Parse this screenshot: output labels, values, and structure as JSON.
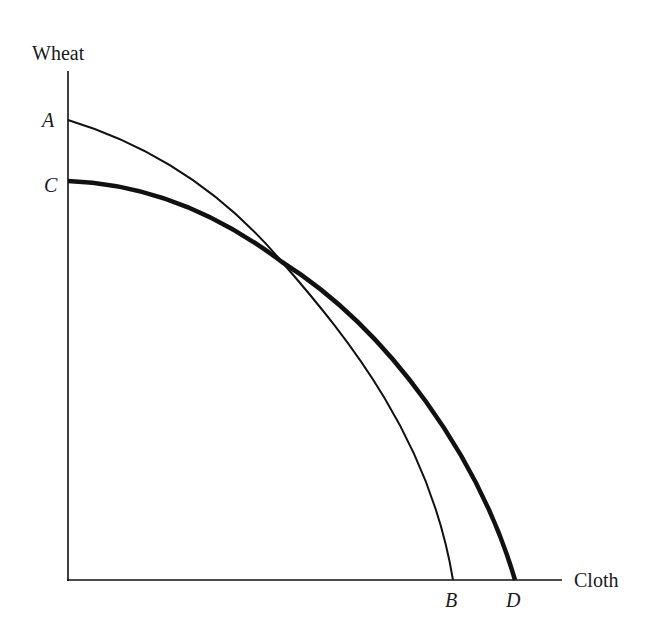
{
  "diagram": {
    "type": "production-possibility-frontier",
    "y_axis_label": "Wheat",
    "x_axis_label": "Cloth",
    "points": {
      "A": "A",
      "B": "B",
      "C": "C",
      "D": "D"
    },
    "curves": [
      {
        "name": "AB",
        "from": "A",
        "to": "B",
        "weight": "thin"
      },
      {
        "name": "CD",
        "from": "C",
        "to": "D",
        "weight": "thick"
      }
    ],
    "colors": {
      "line": "#111111",
      "background": "#ffffff"
    }
  }
}
